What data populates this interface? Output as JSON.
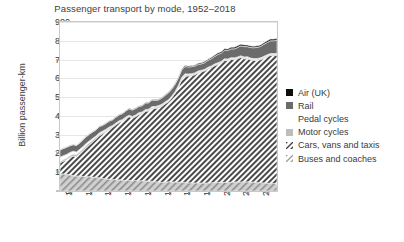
{
  "chart_data": {
    "type": "area",
    "stacked": true,
    "title": "Passenger transport by mode, 1952–2018",
    "xlabel": "",
    "ylabel": "Billion passenger-km",
    "ylim": [
      0,
      900
    ],
    "ytick_labels": [
      "0",
      "100",
      "200",
      "300",
      "400",
      "500",
      "600",
      "700",
      "800",
      "900"
    ],
    "yticks": [
      0,
      100,
      200,
      300,
      400,
      500,
      600,
      700,
      800,
      900
    ],
    "xlim": [
      1952,
      2018
    ],
    "xtick_labels": [
      "1955",
      "1961",
      "1967",
      "1973",
      "1979",
      "1985",
      "1991",
      "1997",
      "2003",
      "2009",
      "2015"
    ],
    "xticks": [
      1955,
      1961,
      1967,
      1973,
      1979,
      1985,
      1991,
      1997,
      2003,
      2009,
      2015
    ],
    "grid": "horizontal",
    "legend_position": "right",
    "legend_order_top_to_bottom": [
      "Air (UK)",
      "Rail",
      "Pedal cycles",
      "Motor cycles",
      "Cars, vans and taxis",
      "Buses and coaches"
    ],
    "x": [
      1952,
      1953,
      1954,
      1955,
      1956,
      1957,
      1958,
      1959,
      1960,
      1961,
      1962,
      1963,
      1964,
      1965,
      1966,
      1967,
      1968,
      1969,
      1970,
      1971,
      1972,
      1973,
      1974,
      1975,
      1976,
      1977,
      1978,
      1979,
      1980,
      1981,
      1982,
      1983,
      1984,
      1985,
      1986,
      1987,
      1988,
      1989,
      1990,
      1991,
      1992,
      1993,
      1994,
      1995,
      1996,
      1997,
      1998,
      1999,
      2000,
      2001,
      2002,
      2003,
      2004,
      2005,
      2006,
      2007,
      2008,
      2009,
      2010,
      2011,
      2012,
      2013,
      2014,
      2015,
      2016,
      2017,
      2018
    ],
    "series": [
      {
        "name": "Buses and coaches",
        "swatch": "light-hatch",
        "color": "#c3c3c3",
        "values": [
          92,
          91,
          89,
          86,
          82,
          80,
          79,
          77,
          77,
          76,
          74,
          72,
          70,
          67,
          65,
          63,
          61,
          60,
          60,
          57,
          56,
          56,
          56,
          56,
          55,
          54,
          54,
          52,
          52,
          49,
          48,
          46,
          48,
          49,
          48,
          48,
          47,
          46,
          46,
          44,
          43,
          43,
          43,
          43,
          42,
          43,
          44,
          45,
          46,
          46,
          46,
          46,
          47,
          48,
          48,
          48,
          49,
          49,
          48,
          47,
          45,
          44,
          43,
          42,
          41,
          40,
          38
        ]
      },
      {
        "name": "Cars, vans and taxis",
        "swatch": "dense-hatch",
        "color": "#585858",
        "values": [
          58,
          68,
          78,
          92,
          104,
          103,
          120,
          137,
          155,
          171,
          188,
          205,
          224,
          238,
          252,
          266,
          278,
          292,
          305,
          316,
          330,
          340,
          333,
          340,
          353,
          358,
          371,
          374,
          388,
          391,
          396,
          405,
          416,
          426,
          448,
          472,
          505,
          547,
          567,
          568,
          572,
          576,
          586,
          592,
          598,
          607,
          613,
          622,
          628,
          635,
          649,
          648,
          654,
          652,
          657,
          663,
          655,
          656,
          650,
          648,
          651,
          655,
          664,
          673,
          681,
          682,
          685
        ]
      },
      {
        "name": "Motor cycles",
        "swatch": "solid-light",
        "color": "#bdbdbd",
        "values": [
          7,
          8,
          9,
          10,
          11,
          11,
          10,
          11,
          11,
          11,
          10,
          9,
          8,
          7,
          6,
          6,
          5,
          5,
          4,
          4,
          4,
          4,
          4,
          4,
          4,
          4,
          4,
          5,
          5,
          5,
          6,
          6,
          6,
          6,
          5,
          5,
          5,
          6,
          6,
          6,
          5,
          5,
          5,
          4,
          4,
          5,
          5,
          5,
          5,
          5,
          5,
          5,
          5,
          5,
          5,
          5,
          5,
          5,
          5,
          5,
          5,
          5,
          5,
          5,
          5,
          5,
          5
        ]
      },
      {
        "name": "Pedal cycles",
        "swatch": "blank",
        "color": "#ffffff",
        "values": [
          23,
          21,
          19,
          17,
          15,
          14,
          13,
          12,
          11,
          10,
          9,
          8,
          8,
          7,
          6,
          6,
          5,
          5,
          5,
          4,
          4,
          4,
          4,
          5,
          5,
          5,
          5,
          5,
          5,
          5,
          5,
          5,
          5,
          5,
          5,
          5,
          5,
          5,
          5,
          5,
          5,
          5,
          5,
          4,
          4,
          4,
          4,
          4,
          4,
          4,
          4,
          4,
          4,
          4,
          4,
          4,
          5,
          5,
          5,
          5,
          5,
          5,
          5,
          5,
          5,
          5,
          5
        ]
      },
      {
        "name": "Rail",
        "swatch": "solid-dark",
        "color": "#6b6b6b",
        "values": [
          39,
          38,
          38,
          36,
          35,
          35,
          34,
          35,
          35,
          35,
          34,
          32,
          33,
          31,
          31,
          31,
          30,
          31,
          31,
          31,
          32,
          34,
          34,
          34,
          33,
          33,
          34,
          34,
          34,
          33,
          30,
          33,
          34,
          36,
          36,
          38,
          40,
          40,
          39,
          38,
          37,
          36,
          35,
          34,
          35,
          37,
          38,
          40,
          44,
          44,
          45,
          45,
          47,
          48,
          50,
          53,
          55,
          54,
          56,
          58,
          59,
          61,
          64,
          66,
          68,
          68,
          70
        ]
      },
      {
        "name": "Air (UK)",
        "swatch": "solid-black",
        "color": "#0d0d0d",
        "values": [
          1,
          1,
          1,
          1,
          1,
          1,
          1,
          2,
          2,
          2,
          2,
          2,
          2,
          2,
          2,
          2,
          2,
          2,
          2,
          2,
          2,
          3,
          3,
          3,
          3,
          3,
          3,
          3,
          3,
          3,
          3,
          3,
          3,
          4,
          4,
          4,
          4,
          5,
          5,
          5,
          5,
          5,
          6,
          6,
          6,
          6,
          7,
          7,
          8,
          8,
          8,
          8,
          9,
          9,
          9,
          9,
          9,
          8,
          8,
          8,
          8,
          8,
          8,
          9,
          9,
          9,
          9
        ]
      }
    ]
  },
  "legend": {
    "items": [
      {
        "label": "Air (UK)",
        "swatch": "solid-black"
      },
      {
        "label": "Rail",
        "swatch": "solid-dark"
      },
      {
        "label": "Pedal cycles",
        "swatch": "blank"
      },
      {
        "label": "Motor cycles",
        "swatch": "solid-light"
      },
      {
        "label": "Cars, vans and taxis",
        "swatch": "dense-hatch"
      },
      {
        "label": "Buses and coaches",
        "swatch": "light-hatch"
      }
    ]
  }
}
